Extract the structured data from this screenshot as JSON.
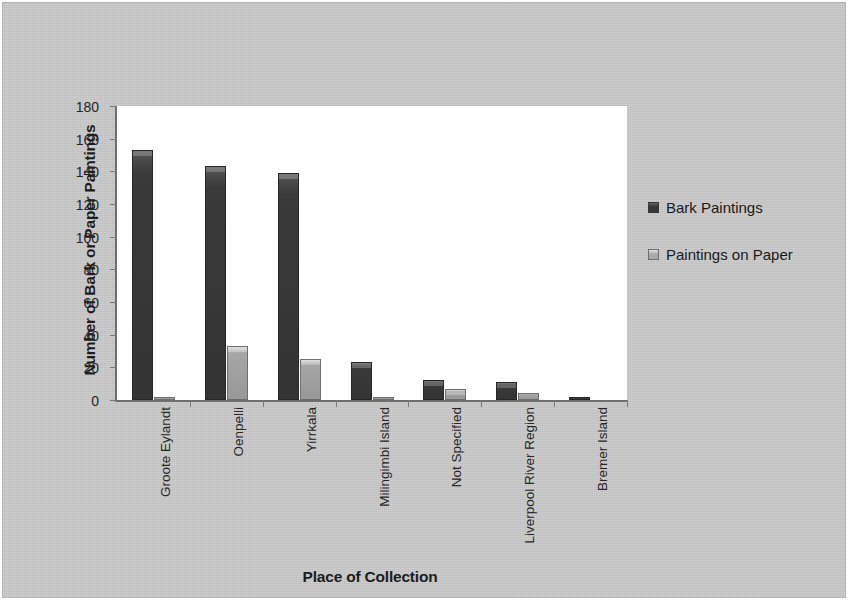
{
  "chart_data": {
    "type": "bar",
    "title": "",
    "xlabel": "Place of Collection",
    "ylabel": "Number of Bark or Paper Paintings",
    "ylim": [
      0,
      180
    ],
    "yticks": [
      0,
      20,
      40,
      60,
      80,
      100,
      120,
      140,
      160,
      180
    ],
    "grid": false,
    "legend_position": "right",
    "categories": [
      "Groote Eylandt",
      "Oenpelli",
      "Yirrkala",
      "Milingimbi Island",
      "Not Specified",
      "Liverpool River Region",
      "Bremer Island"
    ],
    "series": [
      {
        "name": "Bark Paintings",
        "color": "#3a3a3a",
        "values": [
          153,
          143,
          139,
          23,
          12,
          11,
          1
        ]
      },
      {
        "name": "Paintings on Paper",
        "color": "#a0a0a0",
        "values": [
          1,
          33,
          25,
          2,
          7,
          4,
          0
        ]
      }
    ]
  },
  "legend": {
    "items": [
      {
        "label": "Bark Paintings",
        "swatch": "legend-swatch-dark"
      },
      {
        "label": "Paintings on Paper",
        "swatch": "legend-swatch-light"
      }
    ]
  },
  "colors": {
    "panel_background": "#c9c9c9",
    "plot_background": "#ffffff",
    "axis": "#6e6e6e",
    "bark_series": "#3a3a3a",
    "paper_series": "#a0a0a0",
    "text": "#1d1d1d"
  }
}
